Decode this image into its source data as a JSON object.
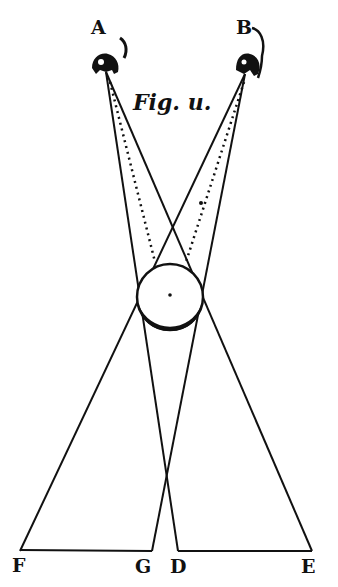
{
  "figure": {
    "caption": "Fig. u.",
    "stroke_color": "#111111",
    "background": "#ffffff",
    "points": {
      "A": {
        "label": "A",
        "x": 103,
        "y": 62
      },
      "B": {
        "label": "B",
        "x": 245,
        "y": 62
      },
      "F": {
        "label": "F",
        "x": 20,
        "y": 551
      },
      "G": {
        "label": "G",
        "x": 152,
        "y": 551
      },
      "D": {
        "label": "D",
        "x": 178,
        "y": 551
      },
      "E": {
        "label": "E",
        "x": 312,
        "y": 551
      }
    },
    "sphere": {
      "cx": 170,
      "cy": 297,
      "r": 33
    },
    "solid_lines": [
      {
        "from": "A",
        "to": "D"
      },
      {
        "from": "A",
        "to": "E"
      },
      {
        "from": "B",
        "to": "F"
      },
      {
        "from": "B",
        "to": "G"
      }
    ],
    "dotted_lines": [
      {
        "from": "A",
        "to": "sphere-top-left"
      },
      {
        "from": "B",
        "to": "sphere-top-right"
      }
    ],
    "base_segments": [
      {
        "from": "F",
        "to": "G"
      },
      {
        "from": "D",
        "to": "E"
      }
    ]
  }
}
